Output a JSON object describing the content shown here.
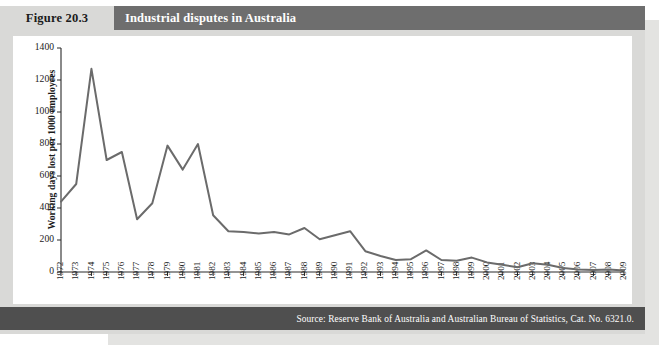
{
  "figure": {
    "number_label": "Figure 20.3",
    "title": "Industrial disputes in Australia",
    "source": "Source: Reserve Bank of Australia and Australian Bureau of Statistics, Cat. No. 6321.0.",
    "colors": {
      "panel_background": "#d9d9d7",
      "title_bar": "#6e6e6e",
      "source_bar": "#4f4f4f",
      "plot_background": "#ffffff",
      "series_line": "#6b6b6b",
      "axis": "#2a2a2a"
    }
  },
  "chart_data": {
    "type": "line",
    "title": "Industrial disputes in Australia",
    "xlabel": "",
    "ylabel": "Working days lost per 1000 employees",
    "ylim": [
      0,
      1400
    ],
    "yticks": [
      0,
      200,
      400,
      600,
      800,
      1000,
      1200,
      1400
    ],
    "grid": false,
    "legend": "none",
    "categories": [
      "1972",
      "1973",
      "1974",
      "1975",
      "1976",
      "1977",
      "1978",
      "1979",
      "1980",
      "1981",
      "1982",
      "1983",
      "1984",
      "1985",
      "1986",
      "1987",
      "1988",
      "1989",
      "1990",
      "1991",
      "1992",
      "1993",
      "1994",
      "1995",
      "1996",
      "1997",
      "1998",
      "1999",
      "2000",
      "2001",
      "2002",
      "2003",
      "2004",
      "2005",
      "2006",
      "2007",
      "2008",
      "2009"
    ],
    "series": [
      {
        "name": "Working days lost per 1000 employees",
        "values": [
          440,
          550,
          1270,
          700,
          750,
          330,
          430,
          790,
          640,
          800,
          355,
          255,
          250,
          240,
          250,
          235,
          275,
          205,
          230,
          255,
          130,
          100,
          75,
          80,
          135,
          75,
          70,
          90,
          60,
          45,
          30,
          55,
          45,
          25,
          15,
          12,
          15,
          10
        ]
      }
    ]
  }
}
